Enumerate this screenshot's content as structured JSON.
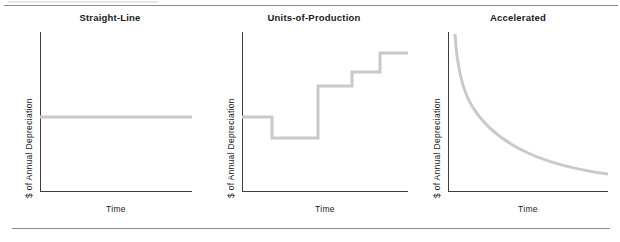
{
  "figure": {
    "background": "#ffffff",
    "rule_color": "#8a8a8a",
    "axis_color": "#3d3d3d",
    "series_color": "#c9c9c9",
    "title_color": "#1a1a1a"
  },
  "panels": [
    {
      "title": "Straight-Line",
      "ylabel": "$ of Annual Depreciation",
      "xlabel": "Time"
    },
    {
      "title": "Units-of-Production",
      "ylabel": "$ of Annual Depreciation",
      "xlabel": "Time"
    },
    {
      "title": "Accelerated",
      "ylabel": "$ of Annual Depreciation",
      "xlabel": "Time"
    }
  ],
  "chart_data": [
    {
      "type": "line",
      "title": "Straight-Line",
      "xlabel": "Time",
      "ylabel": "$ of Annual Depreciation",
      "xlim": [
        0,
        100
      ],
      "ylim": [
        0,
        100
      ],
      "grid": false,
      "legend": "none",
      "ticks": {
        "x": [],
        "y": []
      },
      "series": [
        {
          "name": "Straight-Line Depreciation",
          "x": [
            0,
            100
          ],
          "values": [
            47,
            47
          ]
        }
      ],
      "annotations": [
        "Annual depreciation expense is constant over time"
      ],
      "path": "M 0 85 L 152 85"
    },
    {
      "type": "line",
      "title": "Units-of-Production",
      "xlabel": "Time",
      "ylabel": "$ of Annual Depreciation",
      "xlim": [
        0,
        100
      ],
      "ylim": [
        0,
        100
      ],
      "grid": false,
      "legend": "none",
      "ticks": {
        "x": [],
        "y": []
      },
      "series": [
        {
          "name": "Units-of-Production Depreciation",
          "step": "post",
          "x": [
            0,
            18,
            18,
            46,
            46,
            66,
            66,
            83,
            83,
            100
          ],
          "values": [
            47,
            47,
            34,
            34,
            66,
            66,
            75,
            75,
            87,
            87
          ]
        }
      ],
      "annotations": [
        "Depreciation varies with units produced each period"
      ],
      "path": "M 0 85 L 30 85 L 30 106 L 76 106 L 76 54 L 110 54 L 110 40 L 138 40 L 138 21 L 166 21"
    },
    {
      "type": "line",
      "title": "Accelerated",
      "xlabel": "Time",
      "ylabel": "$ of Annual Depreciation",
      "xlim": [
        0,
        100
      ],
      "ylim": [
        0,
        100
      ],
      "grid": false,
      "legend": "none",
      "ticks": {
        "x": [],
        "y": []
      },
      "series": [
        {
          "name": "Accelerated Depreciation",
          "curve": "exponential-decay",
          "x": [
            4,
            8,
            13,
            19,
            25,
            31,
            38,
            44,
            50,
            56,
            63,
            69,
            75,
            81,
            88,
            94,
            100
          ],
          "values": [
            100,
            80,
            64,
            52,
            43,
            36,
            31,
            27,
            24,
            21,
            19,
            17,
            16,
            15,
            14,
            13,
            12
          ]
        }
      ],
      "annotations": [
        "Depreciation is highest in early years and declines over time"
      ],
      "path": "M 7 2 C 9 34, 14 58, 24 74 C 36 94, 56 110, 80 121 C 104 132, 130 138, 160 142"
    }
  ]
}
